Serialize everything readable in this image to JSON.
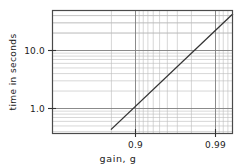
{
  "chart_data": {
    "type": "line",
    "title": "",
    "subtitle": "",
    "xlabel": "gain,  g",
    "ylabel": "time in seconds",
    "grid": true,
    "legend": null,
    "x_scale": "reciprocal-log (log(1/(1-g)))",
    "y_scale": "log",
    "xlim": [
      0.8,
      0.995
    ],
    "ylim": [
      0.4,
      60
    ],
    "xticks": [
      0.9,
      0.99
    ],
    "xtick_labels": [
      "0.9",
      "0.99"
    ],
    "yticks": [
      1.0,
      10.0
    ],
    "ytick_labels": [
      "1.0",
      "10.0"
    ],
    "y_minor_decades": [
      1,
      10
    ],
    "series": [
      {
        "name": "settling time vs gain",
        "points": [
          {
            "x": 0.8,
            "y": 0.44
          },
          {
            "x": 0.85,
            "y": 0.68
          },
          {
            "x": 0.9,
            "y": 1.15
          },
          {
            "x": 0.93,
            "y": 2.0
          },
          {
            "x": 0.95,
            "y": 3.3
          },
          {
            "x": 0.97,
            "y": 7.0
          },
          {
            "x": 0.98,
            "y": 13.0
          },
          {
            "x": 0.99,
            "y": 28.0
          },
          {
            "x": 0.995,
            "y": 55.0
          }
        ],
        "color": "#333333",
        "style": "solid straight line"
      }
    ],
    "annotations": [],
    "colors": {
      "background": "#ffffff",
      "frame": "#4a4a4a",
      "grid_minor": "#b8b8b8",
      "grid_major": "#8a8a8a",
      "data_line": "#333333",
      "text": "#222222"
    }
  },
  "axes": {
    "y_axis_title": "time in seconds",
    "x_axis_title": "gain,  g",
    "y_tick_top_label": "10.0",
    "y_tick_bottom_label": "1.0",
    "x_tick_left_label": "0.9",
    "x_tick_right_label": "0.99"
  }
}
